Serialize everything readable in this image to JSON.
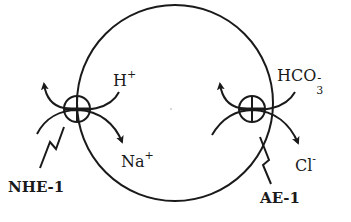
{
  "diagram": {
    "cell": {
      "shape": "circle",
      "stroke": "#1a1a1a"
    },
    "transporters": [
      {
        "name": "NHE-1",
        "label": "NHE-1",
        "position": "left",
        "ions": [
          {
            "symbol": "H",
            "charge": "+",
            "direction": "out"
          },
          {
            "symbol": "Na",
            "charge": "+",
            "direction": "in"
          }
        ]
      },
      {
        "name": "AE-1",
        "label": "AE-1",
        "position": "right",
        "ions": [
          {
            "symbol": "HCO",
            "subscript": "3",
            "charge": "-",
            "direction": "out"
          },
          {
            "symbol": "Cl",
            "charge": "-",
            "direction": "in"
          }
        ]
      }
    ]
  }
}
